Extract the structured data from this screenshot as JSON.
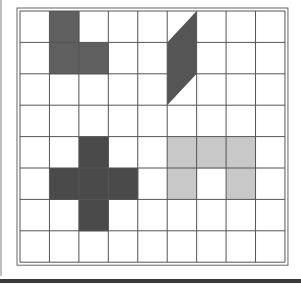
{
  "figure": {
    "grid": {
      "columns": 9,
      "rows": 8,
      "origin_x": 20,
      "origin_y": 11,
      "cell_w": 29.44,
      "cell_h": 31.4,
      "line_color": "#555555",
      "border_color": "#666666"
    },
    "shapes": [
      {
        "name": "l-shape",
        "fill": "#5f5f5f",
        "cells": [
          [
            1,
            0
          ],
          [
            1,
            1
          ],
          [
            2,
            1
          ]
        ]
      },
      {
        "name": "parallelogram",
        "fill": "#555555",
        "polygon": [
          [
            6,
            0
          ],
          [
            6,
            2
          ],
          [
            5,
            3
          ],
          [
            5,
            1
          ]
        ]
      },
      {
        "name": "plus-shape",
        "fill": "#4a4a4a",
        "cells": [
          [
            2,
            4
          ],
          [
            1,
            5
          ],
          [
            2,
            5
          ],
          [
            3,
            5
          ],
          [
            2,
            6
          ]
        ]
      },
      {
        "name": "arch-shape",
        "fill": "#c8c8c8",
        "cells": [
          [
            5,
            4
          ],
          [
            6,
            4
          ],
          [
            7,
            4
          ],
          [
            5,
            5
          ],
          [
            7,
            5
          ]
        ]
      }
    ]
  }
}
